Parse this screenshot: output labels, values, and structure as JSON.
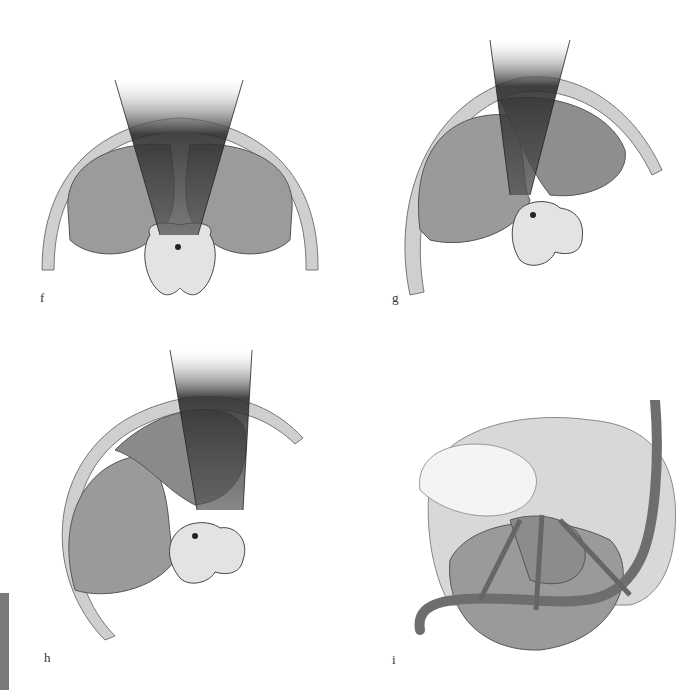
{
  "figure": {
    "panels": [
      {
        "id": "f",
        "label": "f",
        "description": "Axial section: midline sector view between hemispheres toward brainstem"
      },
      {
        "id": "g",
        "label": "g",
        "description": "Axial section: oblique sector view along tentorium toward brainstem"
      },
      {
        "id": "h",
        "label": "h",
        "description": "Axial section: lateral oblique sector view toward brainstem"
      },
      {
        "id": "i",
        "label": "i",
        "description": "Surgical view of cerebellum, temporal lobe and vessels with approach arrows"
      }
    ],
    "colors": {
      "background": "#ffffff",
      "skull": "#c9c9c9",
      "brain": "#9a9a9a",
      "sector_dark": "#3a3a3a",
      "brainstem": "#e2e2e2",
      "side_tab": "#7a7a7a"
    }
  }
}
